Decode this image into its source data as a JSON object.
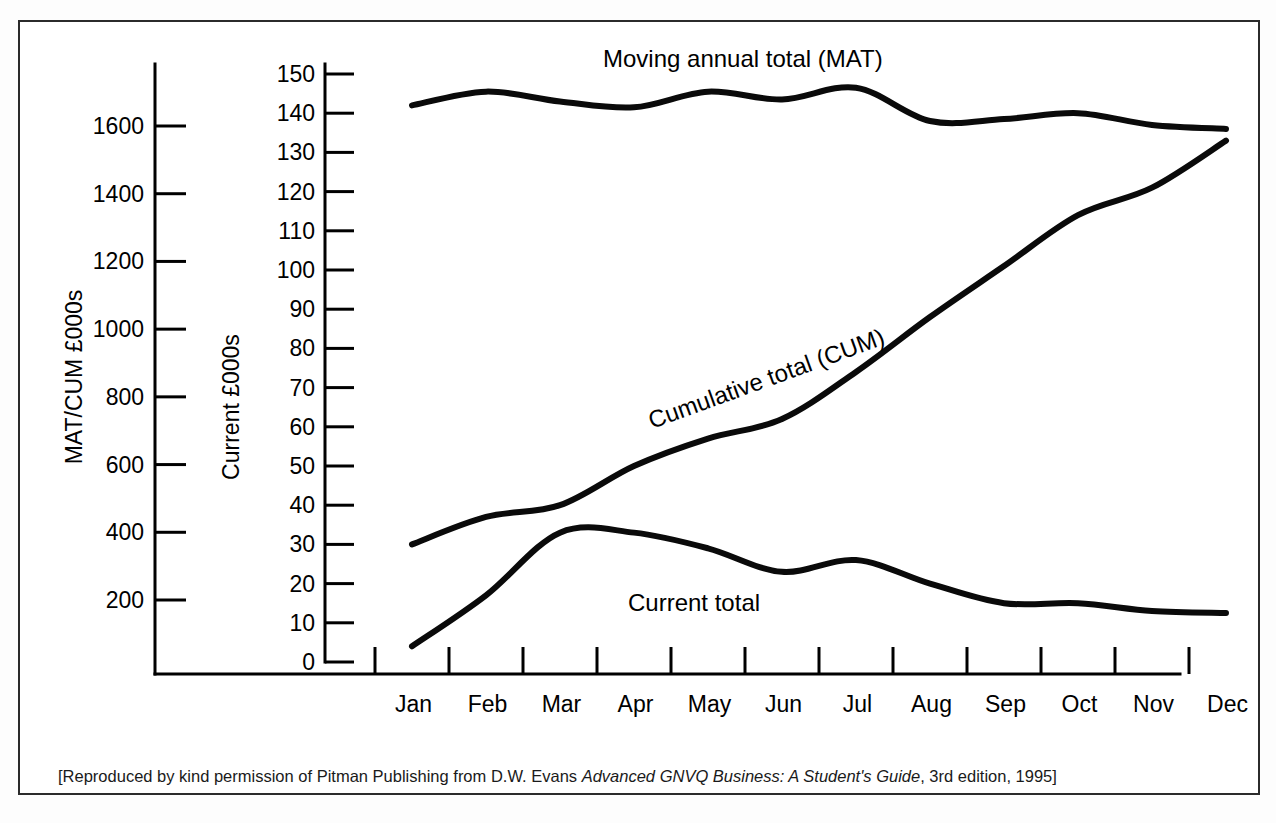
{
  "figure": {
    "caption_prefix": "[Reproduced by kind permission of Pitman Publishing from D.W. Evans ",
    "caption_italic": "Advanced GNVQ Business: A Student's Guide",
    "caption_suffix": ", 3rd edition, 1995]"
  },
  "chart_data": {
    "type": "line",
    "title": "",
    "xlabel": "",
    "grid": false,
    "legend_position": "inline-annotations",
    "x_tick_labels": [
      "Jan",
      "Feb",
      "Mar",
      "Apr",
      "May",
      "Jun",
      "Jul",
      "Aug",
      "Sep",
      "Oct",
      "Nov",
      "Dec"
    ],
    "axes": [
      {
        "name": "left",
        "label": "MAT/CUM £000s",
        "tick_labels": [
          "1600",
          "1400",
          "1200",
          "1000",
          "800",
          "600",
          "400",
          "200"
        ],
        "tick_values": [
          1600,
          1400,
          1200,
          1000,
          800,
          600,
          400,
          200
        ],
        "ylim": [
          0,
          1700
        ]
      },
      {
        "name": "right_inner",
        "label": "Current £000s",
        "tick_labels": [
          "150",
          "140",
          "130",
          "120",
          "110",
          "100",
          "90",
          "80",
          "70",
          "60",
          "50",
          "40",
          "30",
          "20",
          "10",
          "0"
        ],
        "tick_values": [
          150,
          140,
          130,
          120,
          110,
          100,
          90,
          80,
          70,
          60,
          50,
          40,
          30,
          20,
          10,
          0
        ],
        "ylim": [
          0,
          150
        ]
      }
    ],
    "x": [
      "Jan",
      "Feb",
      "Mar",
      "Apr",
      "May",
      "Jun",
      "Jul",
      "Aug",
      "Sep",
      "Oct",
      "Nov",
      "Dec"
    ],
    "series": [
      {
        "name": "Moving annual total (MAT)",
        "annotation": "Moving annual total (MAT)",
        "axis": "right_inner",
        "values": [
          142,
          145.5,
          143,
          141.5,
          145.5,
          143.5,
          146.5,
          138,
          138.5,
          140,
          137,
          136
        ]
      },
      {
        "name": "Cumulative total (CUM)",
        "annotation": "Cumulative total (CUM)",
        "axis": "right_inner",
        "values": [
          30,
          37,
          40,
          50,
          57,
          62,
          74,
          88,
          101,
          114,
          121,
          133
        ]
      },
      {
        "name": "Current total",
        "annotation": "Current total",
        "axis": "right_inner",
        "values": [
          4,
          17,
          33,
          33,
          29,
          23,
          26,
          20,
          15,
          15,
          13,
          12.5
        ]
      }
    ]
  },
  "annotations": {
    "mat": "Moving annual total (MAT)",
    "cum": "Cumulative total (CUM)",
    "current": "Current total"
  },
  "left_axis": {
    "title": "MAT/CUM £000s",
    "ticks": [
      "1600",
      "1400",
      "1200",
      "1000",
      "800",
      "600",
      "400",
      "200"
    ]
  },
  "right_axis": {
    "title": "Current £000s",
    "ticks": [
      "150",
      "140",
      "130",
      "120",
      "110",
      "100",
      "90",
      "80",
      "70",
      "60",
      "50",
      "40",
      "30",
      "20",
      "10",
      "0"
    ]
  },
  "months": [
    "Jan",
    "Feb",
    "Mar",
    "Apr",
    "May",
    "Jun",
    "Jul",
    "Aug",
    "Sep",
    "Oct",
    "Nov",
    "Dec"
  ]
}
